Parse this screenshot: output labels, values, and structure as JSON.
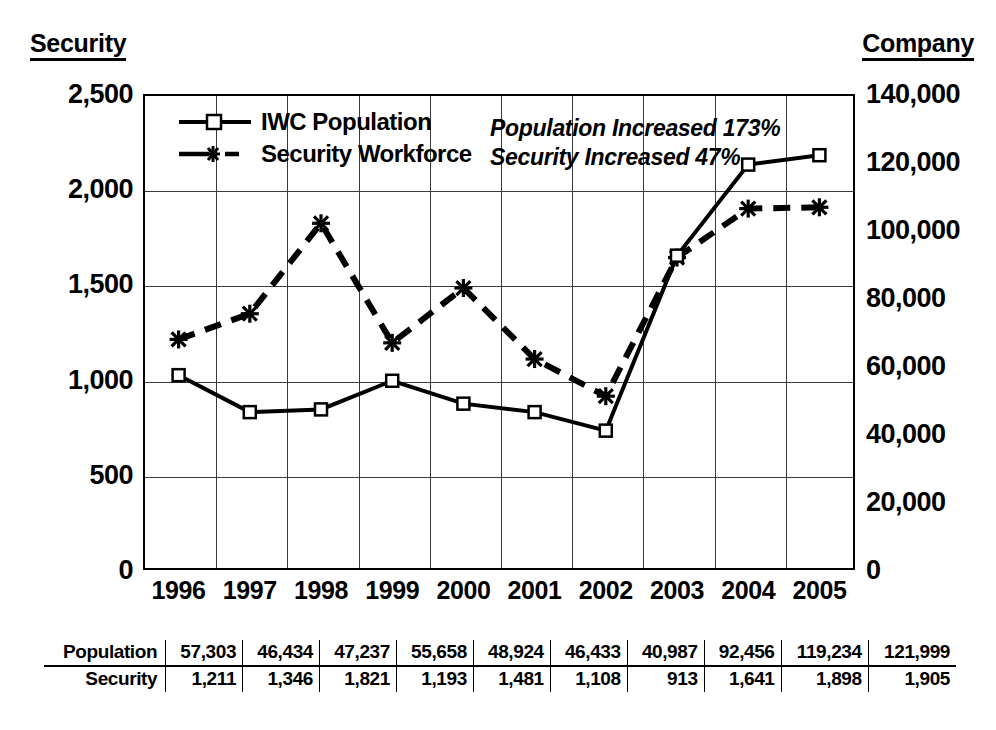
{
  "axes": {
    "left_title": "Security",
    "right_title": "Company",
    "left_ticks": [
      "0",
      "500",
      "1,000",
      "1,500",
      "2,000",
      "2,500"
    ],
    "right_ticks": [
      "0",
      "20,000",
      "40,000",
      "60,000",
      "80,000",
      "100,000",
      "120,000",
      "140,000"
    ],
    "x_ticks": [
      "1996",
      "1997",
      "1998",
      "1999",
      "2000",
      "2001",
      "2002",
      "2003",
      "2004",
      "2005"
    ]
  },
  "legend": {
    "items": [
      {
        "label": "IWC Population",
        "marker": "open-square",
        "line": "solid"
      },
      {
        "label": "Security Workforce",
        "marker": "asterisk",
        "line": "dashed"
      }
    ]
  },
  "annotations": {
    "line1": "Population Increased 173%",
    "line2": "Security Increased 47%"
  },
  "table": {
    "rows": [
      {
        "header": "Population",
        "values": [
          "57,303",
          "46,434",
          "47,237",
          "55,658",
          "48,924",
          "46,433",
          "40,987",
          "92,456",
          "119,234",
          "121,999"
        ]
      },
      {
        "header": "Security",
        "values": [
          "1,211",
          "1,346",
          "1,821",
          "1,193",
          "1,481",
          "1,108",
          "913",
          "1,641",
          "1,898",
          "1,905"
        ]
      }
    ]
  },
  "colors": {
    "ink": "#000000",
    "grid": "#3a3a3a",
    "background": "#ffffff"
  },
  "chart_data": {
    "type": "line",
    "title": "",
    "xlabel": "",
    "categories": [
      "1996",
      "1997",
      "1998",
      "1999",
      "2000",
      "2001",
      "2002",
      "2003",
      "2004",
      "2005"
    ],
    "grid": true,
    "legend_position": "top-left-inside",
    "series": [
      {
        "name": "IWC Population",
        "axis": "right",
        "ylabel": "Company",
        "ylim": [
          0,
          140000
        ],
        "ytick_step": 20000,
        "marker": "open-square",
        "linestyle": "solid",
        "values": [
          57303,
          46434,
          47237,
          55658,
          48924,
          46433,
          40987,
          92456,
          119234,
          121999
        ]
      },
      {
        "name": "Security Workforce",
        "axis": "left",
        "ylabel": "Security",
        "ylim": [
          0,
          2500
        ],
        "ytick_step": 500,
        "marker": "asterisk",
        "linestyle": "dashed",
        "values": [
          1211,
          1346,
          1821,
          1193,
          1481,
          1108,
          913,
          1641,
          1898,
          1905
        ]
      }
    ],
    "annotations": [
      "Population Increased 173%",
      "Security Increased 47%"
    ]
  }
}
